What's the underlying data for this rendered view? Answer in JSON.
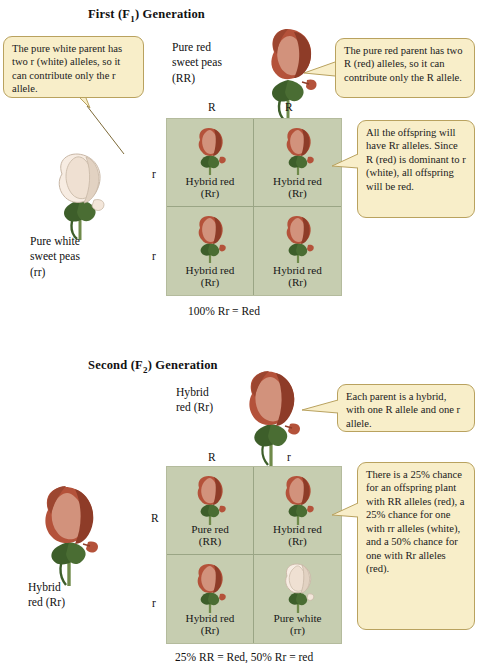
{
  "figure": {
    "colors": {
      "square_bg": "#c6cdb0",
      "square_grid_line": "#9aa585",
      "callout_bg": "#f8eec9",
      "callout_border": "#b9a25f",
      "red_flower": "#b4523a",
      "red_flower_dark": "#8e3c28",
      "red_flower_light": "#d2927c",
      "white_flower": "#f7ece2",
      "white_flower_shade": "#e2d2c2",
      "stem_green": "#3d5e2a",
      "text": "#1a1a1a"
    }
  },
  "f1": {
    "title_main": "First (F",
    "title_sub": "1",
    "title_end": ") Generation",
    "title_full": "First (F1) Generation",
    "top_parent": {
      "line1": "Pure red",
      "line2": "sweet peas",
      "line3": "(RR)",
      "icon": "red-sweet-pea-flower"
    },
    "left_parent": {
      "line1": "Pure white",
      "line2": "sweet peas",
      "line3": "(rr)",
      "icon": "white-sweet-pea-flower"
    },
    "callout_left": {
      "text": "The pure white parent has two r (white) alleles, so it can contribute only the r allele."
    },
    "callout_right": {
      "text": "The pure red parent has two R (red) alleles, so it can contribute only the R allele."
    },
    "callout_result": {
      "text": "All the offspring will have Rr alleles. Since R (red) is dominant to r (white), all offspring will be red."
    },
    "column_alleles": [
      "R",
      "R"
    ],
    "row_alleles": [
      "r",
      "r"
    ],
    "cells": [
      {
        "label": "Hybrid red",
        "genotype": "(Rr)",
        "flower": "red"
      },
      {
        "label": "Hybrid red",
        "genotype": "(Rr)",
        "flower": "red"
      },
      {
        "label": "Hybrid red",
        "genotype": "(Rr)",
        "flower": "red"
      },
      {
        "label": "Hybrid red",
        "genotype": "(Rr)",
        "flower": "red"
      }
    ],
    "caption": "100% Rr = Red"
  },
  "f2": {
    "title_main": "Second (F",
    "title_sub": "2",
    "title_end": ") Generation",
    "title_full": "Second (F2) Generation",
    "top_parent": {
      "line1": "Hybrid",
      "line2": "red (Rr)",
      "line3": "",
      "icon": "red-sweet-pea-flower"
    },
    "left_parent": {
      "line1": "Hybrid",
      "line2": "red (Rr)",
      "line3": "",
      "icon": "red-sweet-pea-flower"
    },
    "callout_right": {
      "text": "Each parent is a hybrid, with one R allele and one r allele."
    },
    "callout_result": {
      "text": "There is a 25% chance for an offspring plant with RR alleles (red), a 25% chance for one with rr alleles (white), and a 50% chance for one with Rr alleles (red)."
    },
    "column_alleles": [
      "R",
      "r"
    ],
    "row_alleles": [
      "R",
      "r"
    ],
    "cells": [
      {
        "label": "Pure red",
        "genotype": "(RR)",
        "flower": "red"
      },
      {
        "label": "Hybrid red",
        "genotype": "(Rr)",
        "flower": "red"
      },
      {
        "label": "Hybrid red",
        "genotype": "(Rr)",
        "flower": "red"
      },
      {
        "label": "Pure white",
        "genotype": "(rr)",
        "flower": "white"
      }
    ],
    "caption": "25% RR = Red, 50% Rr = red"
  }
}
